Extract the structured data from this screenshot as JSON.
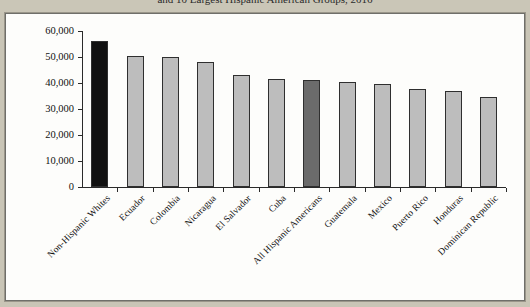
{
  "figure": {
    "title": "and 10 Largest Hispanic American Groups, 2016"
  },
  "chart_data": {
    "type": "bar",
    "title": "and 10 Largest Hispanic American Groups, 2016",
    "xlabel": "",
    "ylabel": "",
    "ylim": [
      0,
      60000
    ],
    "ytick_values": [
      0,
      10000,
      20000,
      30000,
      40000,
      50000,
      60000
    ],
    "ytick_labels": [
      "0",
      "10,000",
      "20,000",
      "30,000",
      "40,000",
      "50,000",
      "60,000"
    ],
    "grid": false,
    "legend": "none",
    "categories": [
      "Non-Hispanic Whites",
      "Ecuador",
      "Colombia",
      "Nicaragua",
      "El Salvador",
      "Cuba",
      "All Hispanic Americans",
      "Guatemala",
      "Mexico",
      "Puerto Rico",
      "Honduras",
      "Dominican Republic"
    ],
    "values": [
      56000,
      50200,
      50100,
      48000,
      43000,
      41500,
      41000,
      40200,
      39800,
      37500,
      37000,
      34500
    ],
    "bar_colors": [
      "#111111",
      "#bdbdbd",
      "#bdbdbd",
      "#bdbdbd",
      "#bdbdbd",
      "#bdbdbd",
      "#6b6b6b",
      "#bdbdbd",
      "#bdbdbd",
      "#bdbdbd",
      "#bdbdbd",
      "#bdbdbd"
    ]
  },
  "colors": {
    "page_background": "#c9c5b6",
    "panel_background": "#fdfdfb",
    "axis": "#2a2a2a",
    "highlight_black": "#111111",
    "highlight_gray": "#6b6b6b",
    "bar_gray": "#bdbdbd"
  }
}
